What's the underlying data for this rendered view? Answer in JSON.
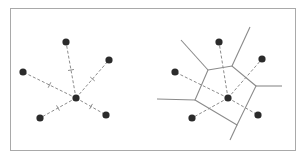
{
  "colors": {
    "frame": "#a9a9a9",
    "point": "#2b2b2b",
    "dashed_line": "#8c8c8c",
    "cell_edge": "#8a8a8a"
  },
  "left_panel": {
    "description": "Center point connected to five neighbors with dashed lines; each line has a perpendicular bisector tick",
    "center": [
      76,
      98
    ],
    "neighbors": [
      [
        66,
        42
      ],
      [
        109,
        60
      ],
      [
        23,
        72
      ],
      [
        40,
        118
      ],
      [
        106,
        115
      ]
    ]
  },
  "right_panel": {
    "description": "Voronoi cell of the center point formed by perpendicular bisectors",
    "center": [
      228,
      98
    ],
    "neighbors": [
      [
        219,
        42
      ],
      [
        262,
        59
      ],
      [
        175,
        72
      ],
      [
        192,
        118
      ],
      [
        258,
        115
      ]
    ],
    "cell_vertices": [
      [
        208,
        70
      ],
      [
        232,
        66
      ],
      [
        256,
        86
      ],
      [
        237,
        125
      ],
      [
        195,
        100
      ]
    ],
    "rays": [
      [
        [
          208,
          70
        ],
        [
          181,
          40
        ]
      ],
      [
        [
          232,
          66
        ],
        [
          250,
          27
        ]
      ],
      [
        [
          256,
          86
        ],
        [
          282,
          86
        ]
      ],
      [
        [
          237,
          125
        ],
        [
          230,
          140
        ]
      ],
      [
        [
          195,
          100
        ],
        [
          157,
          99
        ]
      ]
    ]
  }
}
